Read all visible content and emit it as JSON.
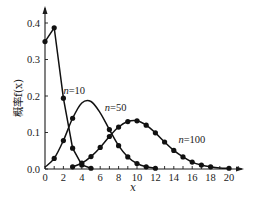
{
  "chart_data": {
    "type": "line",
    "title": "",
    "xlabel": "x",
    "ylabel": "概率f(x)",
    "xlim": [
      0,
      20.5
    ],
    "ylim": [
      0,
      0.43
    ],
    "grid": false,
    "legend_position": "inline labels",
    "x_ticks": [
      0,
      2,
      4,
      6,
      8,
      10,
      12,
      14,
      16,
      18,
      20
    ],
    "x_tick_labels": [
      "0",
      "2",
      "4",
      "6",
      "8",
      "10",
      "12",
      "14",
      "16",
      "18",
      "20"
    ],
    "y_ticks": [
      0.0,
      0.1,
      0.2,
      0.3,
      0.4
    ],
    "y_tick_labels": [
      "0.0",
      "0.1",
      "0.2",
      "0.3",
      "0.4"
    ],
    "series": [
      {
        "name": "n=10",
        "label_pos": [
          2.0,
          0.205
        ],
        "x": [
          0,
          1,
          2,
          3,
          4,
          5
        ],
        "values": [
          0.349,
          0.387,
          0.194,
          0.057,
          0.011,
          0.002
        ],
        "markers": [
          0,
          1,
          2,
          3,
          4,
          5
        ]
      },
      {
        "name": "n=50",
        "label_pos": [
          6.5,
          0.16
        ],
        "x": [
          0,
          1,
          2,
          3,
          4,
          5,
          6,
          7,
          8,
          9,
          10,
          11,
          12
        ],
        "values": [
          0.005,
          0.029,
          0.078,
          0.139,
          0.181,
          0.185,
          0.154,
          0.108,
          0.064,
          0.033,
          0.015,
          0.006,
          0.002
        ],
        "markers": [
          1,
          2,
          3,
          7,
          8,
          9,
          10,
          11,
          12
        ]
      },
      {
        "name": "n=100",
        "label_pos": [
          14.5,
          0.07
        ],
        "x": [
          3,
          4,
          5,
          6,
          7,
          8,
          9,
          10,
          11,
          12,
          13,
          14,
          15,
          16,
          17,
          18,
          19,
          20
        ],
        "values": [
          0.006,
          0.016,
          0.034,
          0.059,
          0.089,
          0.115,
          0.13,
          0.132,
          0.12,
          0.099,
          0.074,
          0.051,
          0.033,
          0.019,
          0.011,
          0.006,
          0.003,
          0.002
        ],
        "markers": [
          3,
          4,
          5,
          6,
          7,
          8,
          9,
          10,
          11,
          12,
          13,
          14,
          15,
          16,
          17,
          18,
          20
        ]
      }
    ]
  }
}
